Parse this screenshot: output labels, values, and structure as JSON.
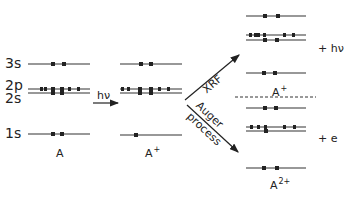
{
  "diagram": {
    "type": "energy-level-diagram",
    "colors": {
      "line": "#333333",
      "electron": "#222222",
      "background": "#ffffff"
    },
    "level_labels": [
      "3s",
      "2p",
      "2s",
      "1s"
    ],
    "states": [
      {
        "id": "initial",
        "label": "A",
        "label_sup": "",
        "occupancy": {
          "3s": 2,
          "2p": 6,
          "2s": 2,
          "1s": 2
        }
      },
      {
        "id": "ionized",
        "label": "A",
        "label_sup": "+",
        "occupancy": {
          "3s": 2,
          "2p": 6,
          "2s": 2,
          "1s": 1
        }
      },
      {
        "id": "after-xrf",
        "label": "A",
        "label_sup": "+",
        "occupancy": {
          "3s": 2,
          "2p": 5,
          "2s": 2,
          "1s": 2
        },
        "emitted": "+ hν"
      },
      {
        "id": "after-auger",
        "label": "A",
        "label_sup": "2+",
        "occupancy": {
          "3s": 2,
          "2p": 5,
          "2s": 1,
          "1s": 2
        },
        "emitted": "+ e"
      }
    ],
    "transitions": [
      {
        "label": "hν",
        "from": "initial",
        "to": "ionized"
      },
      {
        "label": "XRF",
        "from": "ionized",
        "to": "after-xrf"
      },
      {
        "label_line1": "Auger",
        "label_line2": "process",
        "from": "ionized",
        "to": "after-auger"
      }
    ]
  }
}
